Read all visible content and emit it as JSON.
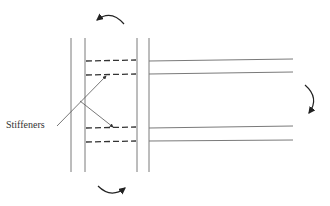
{
  "diagram": {
    "label_stiffeners": "Stiffeners",
    "colors": {
      "line": "#7a7a7a",
      "dash": "#333333",
      "arrow": "#222222",
      "text": "#333333"
    }
  }
}
